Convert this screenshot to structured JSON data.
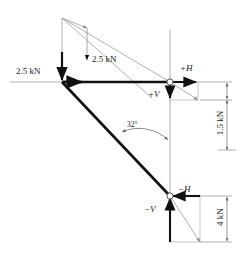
{
  "diagram": {
    "type": "engineering-free-body-diagram",
    "colors": {
      "member": "#111111",
      "construction": "#9a9a9a",
      "dimension": "#6f6f6f",
      "text": "#1a1a1a",
      "background": "#ffffff"
    },
    "labels": {
      "applied_load_left": "2.5 kN",
      "applied_load_inner": "2.5 kN",
      "angle": "32°",
      "top_horizontal_reaction": "+H",
      "top_vertical_reaction": "+V",
      "bottom_horizontal_reaction": "−H",
      "bottom_vertical_reaction": "−V",
      "dimension_upper": "1.5 kN",
      "dimension_lower": "4 kN"
    },
    "geometry": {
      "apex": [
        62,
        18
      ],
      "top_node": [
        170,
        82
      ],
      "bottom_node": [
        170,
        196
      ],
      "baseline_y": 82,
      "vertical_axis_x": 170,
      "member_start": [
        62,
        82
      ],
      "angle_value_deg": 32
    },
    "forces": [
      {
        "name": "applied-load-left",
        "label": "2.5 kN",
        "direction": "down",
        "magnitude": 2.5,
        "unit": "kN"
      },
      {
        "name": "applied-load-inner",
        "label": "2.5 kN",
        "direction": "down",
        "magnitude": 2.5,
        "unit": "kN"
      },
      {
        "name": "top-horizontal",
        "label": "+H",
        "direction": "right",
        "sign": "positive"
      },
      {
        "name": "top-vertical",
        "label": "+V",
        "direction": "down",
        "sign": "positive"
      },
      {
        "name": "bottom-horizontal",
        "label": "−H",
        "direction": "left",
        "sign": "negative"
      },
      {
        "name": "bottom-vertical",
        "label": "−V",
        "direction": "up",
        "sign": "negative"
      }
    ],
    "dimensions": [
      {
        "name": "upper-dimension",
        "label": "1.5 kN",
        "magnitude": 1.5,
        "unit": "kN",
        "orientation": "vertical"
      },
      {
        "name": "lower-dimension",
        "label": "4 kN",
        "magnitude": 4,
        "unit": "kN",
        "orientation": "vertical"
      }
    ]
  }
}
